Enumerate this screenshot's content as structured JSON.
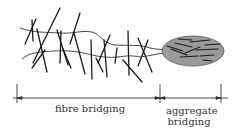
{
  "diagram": {
    "labels": {
      "fibre_bridging": "fibre bridging",
      "aggregate_line1": "aggregate",
      "aggregate_line2": "bridging"
    },
    "colors": {
      "stroke": "#222222",
      "aggregate_fill": "#9a9a9a",
      "background": "#ffffff"
    },
    "regions": [
      {
        "name": "fibre bridging zone",
        "x_start": 17,
        "x_end": 160
      },
      {
        "name": "aggregate bridging zone",
        "x_start": 160,
        "x_end": 221
      }
    ]
  }
}
